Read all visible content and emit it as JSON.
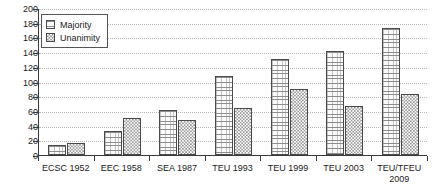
{
  "chart_data": {
    "type": "bar",
    "title": "",
    "subtitle": "",
    "xlabel": "",
    "ylabel": "",
    "ylim": [
      0,
      200
    ],
    "ytick_step": 20,
    "yticks": [
      0,
      20,
      40,
      60,
      80,
      100,
      120,
      140,
      160,
      180,
      200
    ],
    "grid": true,
    "grid_axis": "y",
    "legend_position": "top-left",
    "categories": [
      "ECSC 1952",
      "EEC 1958",
      "SEA 1987",
      "TEU 1993",
      "TEU 1999",
      "TEU 2003",
      "TEU/TFEU\n2009"
    ],
    "series": [
      {
        "name": "Majority",
        "pattern": "horizontal-lines",
        "color": "#fafafa",
        "values": [
          14,
          33,
          61,
          108,
          131,
          142,
          173
        ]
      },
      {
        "name": "Unanimity",
        "pattern": "checkerboard",
        "color": "#f3f3f3",
        "values": [
          16,
          51,
          48,
          64,
          90,
          67,
          83
        ]
      }
    ]
  },
  "legend": {
    "items": [
      {
        "label": "Majority",
        "swatch": "majority-swatch-icon"
      },
      {
        "label": "Unanimity",
        "swatch": "unanimity-swatch-icon"
      }
    ]
  }
}
